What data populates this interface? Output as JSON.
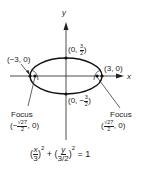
{
  "diagram": {
    "axes": {
      "x_label": "x",
      "y_label": "y"
    },
    "points": {
      "left_vertex": {
        "label_open": "(",
        "x": "−3",
        "sep": ", ",
        "y": "0",
        "label_close": ")"
      },
      "right_vertex": {
        "label_open": "(",
        "x": "3",
        "sep": ", ",
        "y": "0",
        "label_close": ")"
      },
      "top_covertex": {
        "prefix": "(0, ",
        "num": "3",
        "den": "2",
        "suffix": ")"
      },
      "bottom_covertex": {
        "prefix": "(0, −",
        "num": "3",
        "den": "2",
        "suffix": ")"
      }
    },
    "foci": {
      "left": {
        "title": "Focus",
        "prefix": "(−",
        "num": "√27",
        "den": "2",
        "suffix": ", 0)"
      },
      "right": {
        "title": "Focus",
        "prefix": "(",
        "num": "√27",
        "den": "2",
        "suffix": ", 0)"
      }
    },
    "equation": {
      "open1": "(",
      "num1": "x",
      "den1": "3",
      "close1": ")",
      "exp1": "2",
      "plus": " + ",
      "open2": "(",
      "num2": "y",
      "den2": "3/2",
      "close2": ")",
      "exp2": "2",
      "equals": " = 1"
    },
    "colors": {
      "ink": "#222222",
      "background": "#ffffff"
    }
  }
}
